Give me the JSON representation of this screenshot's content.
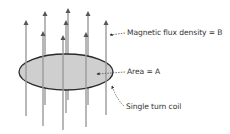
{
  "diagram": {
    "labels": {
      "flux": "Magnetic flux density = B",
      "area": "Area = A",
      "coil": "Single turn coil"
    },
    "colors": {
      "field_line": "#9a9a9a",
      "arrow_head": "#555555",
      "coil_fill": "#cfcfcf",
      "coil_stroke": "#2a2a2a",
      "leader": "#555555"
    }
  }
}
